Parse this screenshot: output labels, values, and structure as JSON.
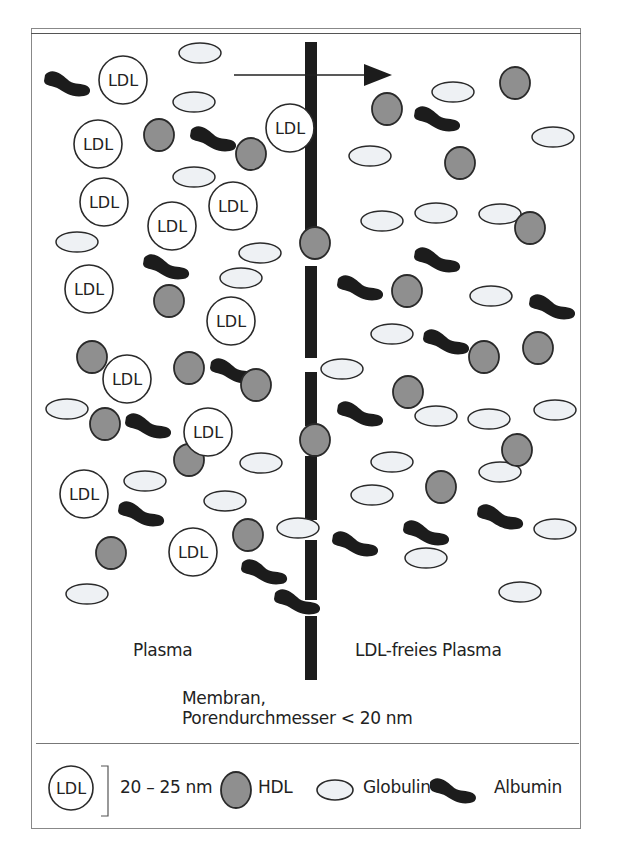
{
  "diagram": {
    "labels": {
      "left_compartment": "Plasma",
      "right_compartment": "LDL-freies Plasma",
      "membrane_line1": "Membran,",
      "membrane_line2": "Porendurchmesser < 20 nm",
      "ldl_text": "LDL"
    },
    "colors": {
      "hdl_fill": "#8f8f8f",
      "globulin_fill": "#eef1f4",
      "albumin_fill": "#1c1c1c",
      "membrane": "#1c1c1c",
      "outline": "#2a2a2a"
    },
    "arrow": {
      "x1": 234,
      "x2": 392,
      "y": 75,
      "direction": "right"
    },
    "membrane_segments": [
      [
        42,
        230
      ],
      [
        266,
        358
      ],
      [
        372,
        426
      ],
      [
        456,
        520
      ],
      [
        540,
        600
      ],
      [
        616,
        680
      ]
    ],
    "ldl": [
      [
        123,
        80
      ],
      [
        98,
        144
      ],
      [
        290,
        128
      ],
      [
        104,
        202
      ],
      [
        233,
        206
      ],
      [
        172,
        226
      ],
      [
        89,
        289
      ],
      [
        231,
        321
      ],
      [
        127,
        379
      ],
      [
        208,
        432
      ],
      [
        84,
        494
      ],
      [
        193,
        552
      ]
    ],
    "hdl": [
      [
        159,
        135
      ],
      [
        251,
        154
      ],
      [
        387,
        109
      ],
      [
        515,
        83
      ],
      [
        460,
        163
      ],
      [
        315,
        243
      ],
      [
        530,
        228
      ],
      [
        169,
        301
      ],
      [
        407,
        291
      ],
      [
        92,
        357
      ],
      [
        189,
        368
      ],
      [
        256,
        385
      ],
      [
        484,
        357
      ],
      [
        538,
        348
      ],
      [
        105,
        424
      ],
      [
        189,
        460
      ],
      [
        315,
        440
      ],
      [
        408,
        392
      ],
      [
        517,
        450
      ],
      [
        441,
        487
      ],
      [
        248,
        535
      ],
      [
        111,
        553
      ]
    ],
    "globulin": [
      [
        200,
        53
      ],
      [
        194,
        102
      ],
      [
        453,
        92
      ],
      [
        553,
        137
      ],
      [
        370,
        156
      ],
      [
        194,
        177
      ],
      [
        77,
        242
      ],
      [
        260,
        253
      ],
      [
        382,
        221
      ],
      [
        436,
        213
      ],
      [
        500,
        214
      ],
      [
        241,
        278
      ],
      [
        491,
        296
      ],
      [
        392,
        334
      ],
      [
        342,
        369
      ],
      [
        67,
        409
      ],
      [
        145,
        481
      ],
      [
        261,
        463
      ],
      [
        436,
        416
      ],
      [
        489,
        419
      ],
      [
        555,
        410
      ],
      [
        392,
        462
      ],
      [
        500,
        472
      ],
      [
        372,
        495
      ],
      [
        225,
        501
      ],
      [
        298,
        528
      ],
      [
        555,
        529
      ],
      [
        426,
        558
      ],
      [
        520,
        592
      ],
      [
        87,
        594
      ]
    ],
    "albumin": [
      [
        67,
        83
      ],
      [
        213,
        138
      ],
      [
        437,
        118
      ],
      [
        166,
        266
      ],
      [
        360,
        287
      ],
      [
        437,
        259
      ],
      [
        552,
        306
      ],
      [
        233,
        370
      ],
      [
        446,
        341
      ],
      [
        148,
        425
      ],
      [
        360,
        413
      ],
      [
        141,
        513
      ],
      [
        355,
        543
      ],
      [
        426,
        532
      ],
      [
        500,
        516
      ],
      [
        264,
        571
      ],
      [
        297,
        601
      ]
    ]
  },
  "legend": {
    "ldl_label": "LDL",
    "size_range": "20 – 25 nm",
    "hdl_label": "HDL",
    "globulin_label": "Globulin",
    "albumin_label": "Albumin"
  }
}
